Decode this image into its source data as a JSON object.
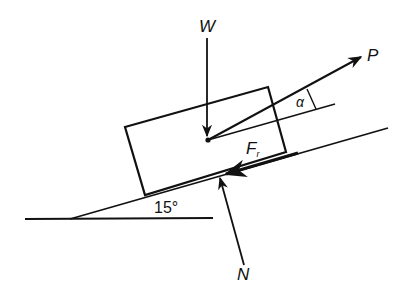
{
  "diagram": {
    "colors": {
      "ink": "#111111",
      "background": "#ffffff"
    },
    "labels": {
      "weight": "W",
      "pull": "P",
      "alpha": "α",
      "friction": "F",
      "friction_sub": "r",
      "normal": "N",
      "incline_angle": "15°"
    },
    "incline_angle_deg": 15
  }
}
